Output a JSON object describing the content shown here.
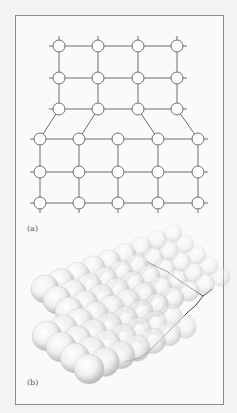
{
  "figure": {
    "panel_a": {
      "label": "(a)",
      "description": "2D square lattice with an edge dislocation: 4 atoms per row in top 3 rows, 5 atoms per row in bottom 3 rows",
      "top_rows": {
        "count": 3,
        "atoms_per_row": 4,
        "x": [
          59,
          98,
          138,
          177
        ],
        "y": [
          46,
          78,
          109
        ]
      },
      "bottom_rows": {
        "count": 3,
        "atoms_per_row": 5,
        "x": [
          40,
          79,
          118,
          158,
          198
        ],
        "y": [
          139,
          172,
          203
        ]
      },
      "atom_radius": 6
    },
    "panel_b": {
      "label": "(b)",
      "description": "3D hard-sphere model of atomic planes showing dislocation"
    },
    "colors": {
      "background": "#f3f3f3",
      "frame": "#8a8a8a",
      "line": "#6e6e6e",
      "atom_fill": "#fdfdfd",
      "sphere_light": "#f0f0f0",
      "sphere_dark": "#b8b8b8"
    }
  }
}
